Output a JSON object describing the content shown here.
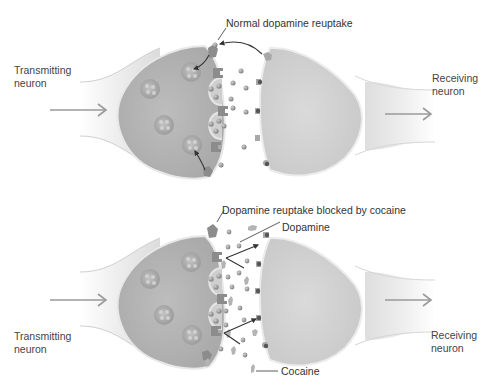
{
  "figure": {
    "panels": [
      {
        "id": "normal",
        "title_annotation": "Normal dopamine reuptake",
        "left_label": [
          "Transmitting",
          "neuron"
        ],
        "right_label": [
          "Receiving",
          "neuron"
        ]
      },
      {
        "id": "cocaine",
        "title_annotation": "Dopamine reuptake blocked by cocaine",
        "dopamine_label": "Dopamine",
        "cocaine_label": "Cocaine",
        "left_label": [
          "Transmitting",
          "neuron"
        ],
        "right_label": [
          "Receiving",
          "neuron"
        ]
      }
    ],
    "colors": {
      "background": "#ffffff",
      "transmitting_body": "#b8b8b8",
      "receiving_body": "#d4d4d4",
      "membrane": "#e6e6e6",
      "axon_light": "#eeeeee",
      "vesicle": "#a8a8a8",
      "dopamine": "#8f8f8f",
      "transporter": "#8a8a8a",
      "cocaine": "#b0b0b0",
      "arrow": "#333333",
      "flow_arrow": "#9a9a9a",
      "text": "#333333"
    }
  }
}
